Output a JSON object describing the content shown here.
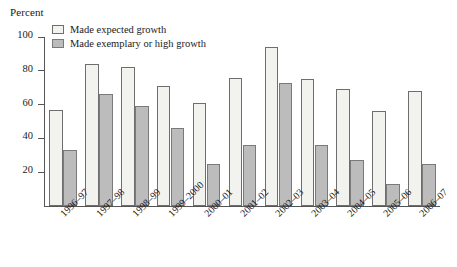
{
  "chart_data": {
    "type": "bar",
    "title": "",
    "ylabel": "Percent",
    "xlabel": "",
    "ylim": [
      0,
      100
    ],
    "yticks": [
      20,
      40,
      60,
      80,
      100
    ],
    "grid": false,
    "legend_position": "top-left inside plot",
    "categories": [
      "1996–97",
      "1997–98",
      "1998–99",
      "1999–2000",
      "2000–01",
      "2001–02",
      "2002–03",
      "2003–04",
      "2004–05",
      "2005–06",
      "2006–07"
    ],
    "series": [
      {
        "name": "Made expected growth",
        "color": "#f2f2ef",
        "values": [
          57,
          84,
          82,
          71,
          61,
          76,
          94,
          75,
          69,
          56,
          68
        ]
      },
      {
        "name": "Made exemplary or high growth",
        "color": "#bcbcbc",
        "values": [
          33,
          66,
          59,
          46,
          25,
          36,
          73,
          36,
          27,
          13,
          25
        ]
      }
    ]
  }
}
